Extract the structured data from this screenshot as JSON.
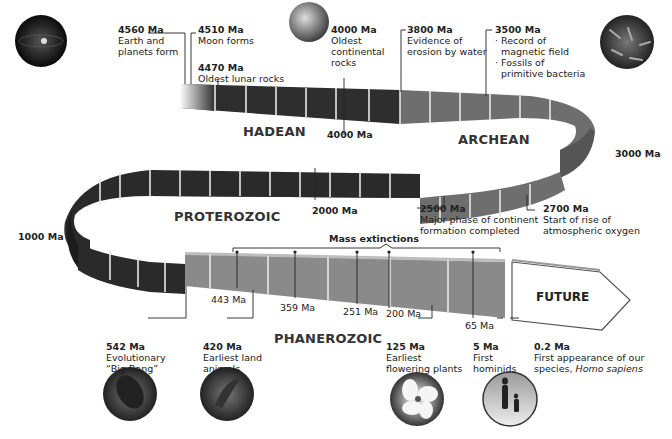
{
  "colors": {
    "hadean": "#2e2e2e",
    "archean": "#6e6e6e",
    "proterozoic": "#2a2a2a",
    "phanerozoic": "#8a8a8a",
    "future": "#ffffff",
    "text": "#222222"
  },
  "eras": {
    "hadean": "HADEAN",
    "archean": "ARCHEAN",
    "proterozoic": "PROTEROZOIC",
    "phanerozoic": "PHANEROZOIC",
    "future": "FUTURE"
  },
  "ticks": {
    "t4000": "4000 Ma",
    "t3000": "3000 Ma",
    "t2000": "2000 Ma",
    "t1000": "1000 Ma"
  },
  "events": {
    "e4560": {
      "date": "4560 Ma",
      "line1": "Earth and",
      "line2": "planets form"
    },
    "e4510": {
      "date": "4510 Ma",
      "line1": "Moon forms"
    },
    "e4470": {
      "date": "4470 Ma",
      "line1": "Oldest lunar rocks"
    },
    "e4000": {
      "date": "4000 Ma",
      "line1": "Oldest",
      "line2": "continental",
      "line3": "rocks"
    },
    "e3800": {
      "date": "3800 Ma",
      "line1": "Evidence of",
      "line2": "erosion by water"
    },
    "e3500": {
      "date": "3500 Ma",
      "line1": "· Record of",
      "line2": "magnetic field",
      "line3": "· Fossils of",
      "line4": "primitive bacteria"
    },
    "e2500": {
      "date": "2500 Ma",
      "line1": "Major phase of continent",
      "line2": "formation completed"
    },
    "e2700": {
      "date": "2700 Ma",
      "line1": "Start of rise of",
      "line2": "atmospheric oxygen"
    },
    "e542": {
      "date": "542 Ma",
      "line1": "Evolutionary",
      "line2": "“Big Bang”"
    },
    "e420": {
      "date": "420 Ma",
      "line1": "Earliest land",
      "line2": "animals"
    },
    "e125": {
      "date": "125 Ma",
      "line1": "Earliest",
      "line2": "flowering plants"
    },
    "e5": {
      "date": "5 Ma",
      "line1": "First",
      "line2": "hominids"
    },
    "e02": {
      "date": "0.2 Ma",
      "line1": "First appearance of our",
      "line2": "species, ",
      "line2_italic": "Homo sapiens"
    }
  },
  "mass_extinctions": {
    "label": "Mass extinctions",
    "dates": [
      "443 Ma",
      "359 Ma",
      "251 Ma",
      "200 Ma",
      "65 Ma"
    ]
  },
  "thumbnails": [
    {
      "name": "planet-formation-image"
    },
    {
      "name": "continental-rock-image"
    },
    {
      "name": "bacteria-fossil-image"
    },
    {
      "name": "trilobite-image"
    },
    {
      "name": "land-animal-image"
    },
    {
      "name": "flowering-plant-image"
    },
    {
      "name": "hominids-image"
    }
  ]
}
